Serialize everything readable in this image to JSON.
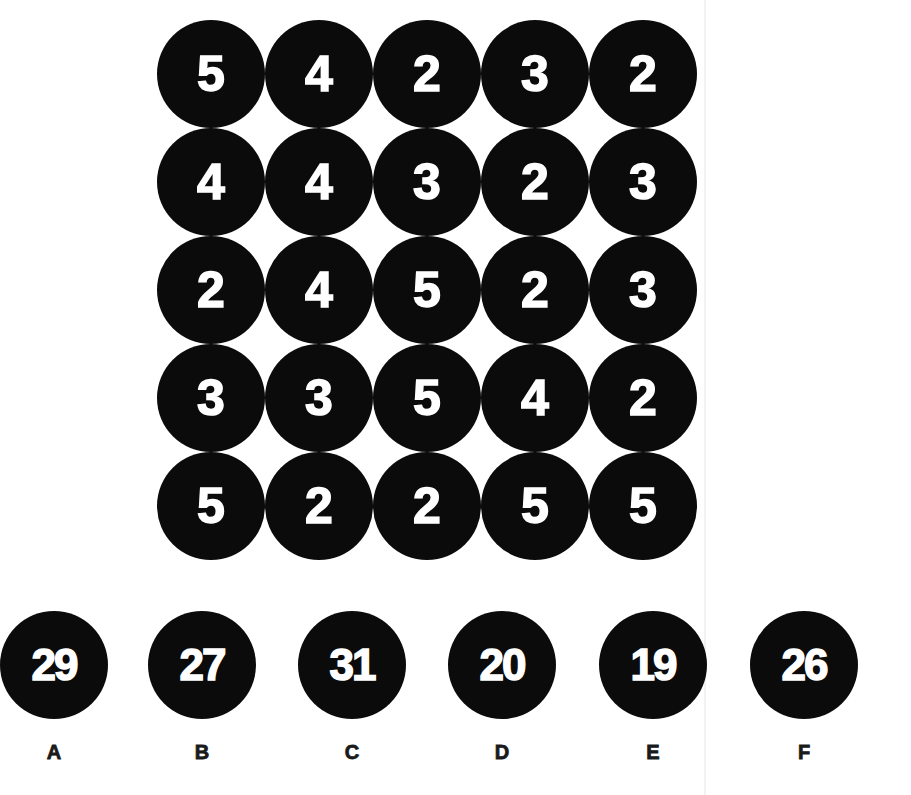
{
  "puzzle": {
    "grid": {
      "rows": 5,
      "cols": 5,
      "cells": [
        [
          5,
          4,
          2,
          3,
          2
        ],
        [
          4,
          4,
          3,
          2,
          3
        ],
        [
          2,
          4,
          5,
          2,
          3
        ],
        [
          3,
          3,
          5,
          4,
          2
        ],
        [
          5,
          2,
          2,
          5,
          5
        ]
      ]
    },
    "options": [
      {
        "label": "A",
        "value": "29"
      },
      {
        "label": "B",
        "value": "27"
      },
      {
        "label": "C",
        "value": "31"
      },
      {
        "label": "D",
        "value": "20"
      },
      {
        "label": "E",
        "value": "19"
      },
      {
        "label": "F",
        "value": "26"
      }
    ]
  },
  "colors": {
    "circle_fill": "#0b0b0b",
    "circle_text": "#ffffff",
    "label_text": "#1a1a1a",
    "background": "#ffffff"
  }
}
